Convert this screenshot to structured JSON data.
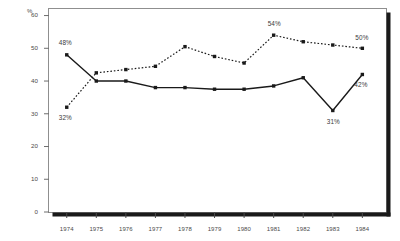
{
  "chart_data": {
    "type": "line",
    "title": "",
    "subtitle": "",
    "xlabel": "",
    "ylabel": "%",
    "ylim": [
      0,
      62
    ],
    "xlim": [
      1973.4,
      1984.8
    ],
    "grid": false,
    "legend_position": "none",
    "categories": [
      "1974",
      "1975",
      "1976",
      "1977",
      "1978",
      "1979",
      "1980",
      "1981",
      "1982",
      "1983",
      "1984"
    ],
    "x": [
      1974,
      1975,
      1976,
      1977,
      1978,
      1979,
      1980,
      1981,
      1982,
      1983,
      1984
    ],
    "yticks": [
      0,
      10,
      20,
      30,
      40,
      50,
      60
    ],
    "ytick_labels": [
      "0",
      "10",
      "20",
      "30",
      "40",
      "50",
      "60"
    ],
    "series": [
      {
        "name": "solid-series",
        "style": "solid",
        "marker": "square",
        "color": "#1a1a1a",
        "values": [
          48,
          40,
          40,
          38,
          38,
          37.5,
          37.5,
          38.5,
          41,
          31,
          42
        ]
      },
      {
        "name": "dotted-series",
        "style": "dotted",
        "marker": "square",
        "color": "#1a1a1a",
        "values": [
          32,
          42.5,
          43.5,
          44.5,
          50.5,
          47.5,
          45.5,
          54,
          52,
          51,
          50
        ]
      }
    ],
    "annotations": [
      {
        "text": "48%",
        "series": "solid-series",
        "x": 1974,
        "y": 48,
        "dx": -2,
        "dy": -11
      },
      {
        "text": "32%",
        "series": "dotted-series",
        "x": 1974,
        "y": 32,
        "dx": -2,
        "dy": 11
      },
      {
        "text": "54%",
        "series": "dotted-series",
        "x": 1981,
        "y": 54,
        "dx": 0,
        "dy": -11
      },
      {
        "text": "50%",
        "series": "dotted-series",
        "x": 1984,
        "y": 50,
        "dx": -1,
        "dy": -10
      },
      {
        "text": "31%",
        "series": "solid-series",
        "x": 1983,
        "y": 31,
        "dx": 0,
        "dy": 12
      },
      {
        "text": "42%",
        "series": "solid-series",
        "x": 1984,
        "y": 42,
        "dx": -2,
        "dy": 11
      }
    ]
  },
  "axis": {
    "unit_label": "%"
  },
  "colors": {
    "frame": "#8a8a8a",
    "shadow": "#1a1a1a",
    "line": "#1a1a1a",
    "text": "#4a4a4a",
    "background": "#ffffff"
  }
}
